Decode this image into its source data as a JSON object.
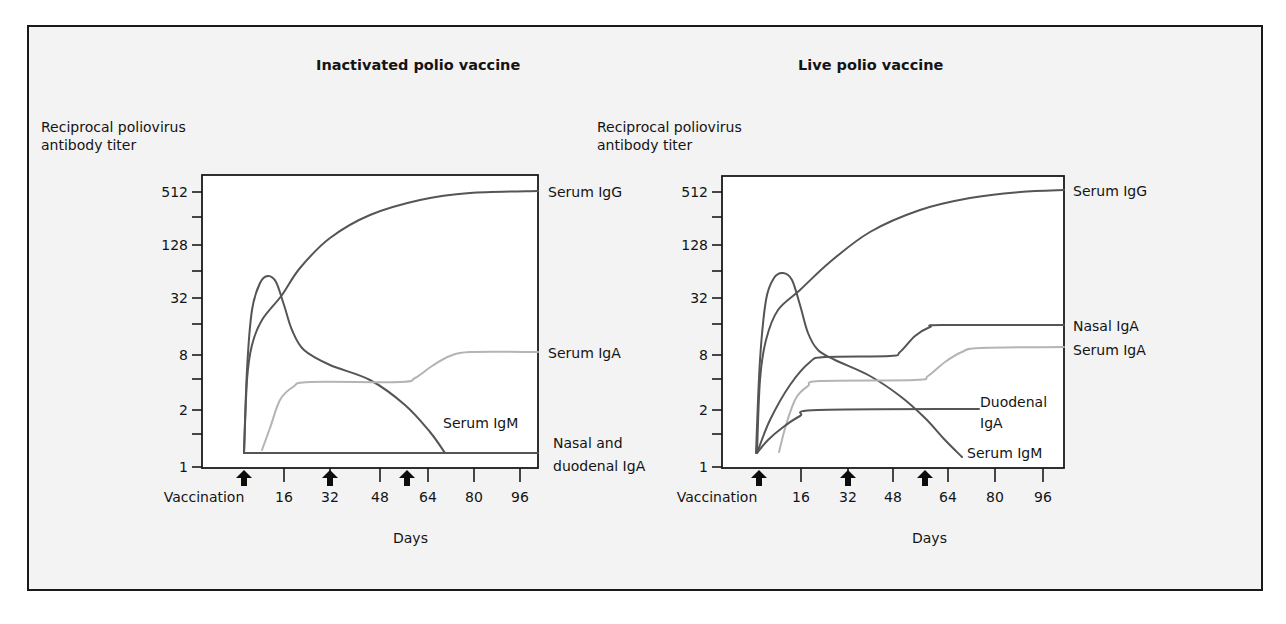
{
  "figure": {
    "background": "#f3f3f3",
    "frame_color": "#1a1a1a",
    "curve_dark": "#555555",
    "curve_light": "#b4b4b4"
  },
  "chart_data": [
    {
      "type": "line",
      "title": "Inactivated polio vaccine",
      "ylabel": "Reciprocal poliovirus antibody titer",
      "ylabel_lines": [
        "Reciprocal poliovirus",
        "antibody titer"
      ],
      "xlabel": "Days",
      "y_scale": "log2",
      "y_ticks": [
        "512",
        "128",
        "32",
        "8",
        "2",
        "1"
      ],
      "y_tick_values": [
        512,
        128,
        32,
        8,
        2,
        1
      ],
      "x_ticks": [
        "Vaccination",
        "16",
        "32",
        "48",
        "64",
        "80",
        "96"
      ],
      "x_tick_values": [
        0,
        16,
        32,
        48,
        64,
        80,
        96
      ],
      "vaccination_arrows_days": [
        0,
        31,
        58
      ],
      "ylim": [
        1,
        768
      ],
      "xlim": [
        -14,
        102
      ],
      "grid": false,
      "legend_position": "inline labels at right of curves",
      "series": [
        {
          "name": "Serum IgG",
          "style": "dark",
          "x": [
            0,
            1,
            3,
            7,
            14,
            22,
            32,
            45,
            60,
            75,
            90,
            102
          ],
          "y": [
            1.25,
            5,
            12,
            20,
            34,
            60,
            110,
            200,
            330,
            430,
            490,
            512
          ]
        },
        {
          "name": "Serum IgM",
          "style": "dark",
          "x": [
            0,
            1,
            3,
            6,
            8,
            11,
            14,
            18,
            24,
            34,
            45,
            55,
            63,
            70
          ],
          "y": [
            1.25,
            6,
            25,
            50,
            55,
            45,
            18,
            10,
            7.5,
            6,
            4.5,
            3,
            1.8,
            1.25
          ]
        },
        {
          "name": "Serum IgA",
          "style": "light",
          "x": [
            6,
            10,
            15,
            20,
            30,
            40,
            55,
            62,
            70,
            80,
            90,
            102
          ],
          "y": [
            1.25,
            2,
            3.6,
            4.5,
            4.8,
            4.8,
            4.8,
            5.2,
            6.8,
            8,
            8,
            8
          ]
        },
        {
          "name": "Nasal and duodenal IgA",
          "style": "dark",
          "x": [
            0,
            102
          ],
          "y": [
            1.25,
            1.25
          ]
        }
      ],
      "curve_labels": [
        {
          "text": "Serum IgG",
          "series": "Serum IgG"
        },
        {
          "text": "Serum IgA",
          "series": "Serum IgA"
        },
        {
          "text": "Serum IgM",
          "series": "Serum IgM"
        },
        {
          "text": "Nasal and",
          "series": "Nasal and duodenal IgA"
        },
        {
          "text": "duodenal IgA",
          "series": "Nasal and duodenal IgA"
        }
      ]
    },
    {
      "type": "line",
      "title": "Live polio vaccine",
      "ylabel": "Reciprocal poliovirus antibody titer",
      "ylabel_lines": [
        "Reciprocal poliovirus",
        "antibody titer"
      ],
      "xlabel": "Days",
      "y_scale": "log2",
      "y_ticks": [
        "512",
        "128",
        "32",
        "8",
        "2",
        "1"
      ],
      "y_tick_values": [
        512,
        128,
        32,
        8,
        2,
        1
      ],
      "x_ticks": [
        "Vaccination",
        "16",
        "32",
        "48",
        "64",
        "80",
        "96"
      ],
      "x_tick_values": [
        0,
        16,
        32,
        48,
        64,
        80,
        96
      ],
      "vaccination_arrows_days": [
        0,
        31,
        58
      ],
      "ylim": [
        1,
        768
      ],
      "xlim": [
        -14,
        102
      ],
      "grid": false,
      "legend_position": "inline labels at right of curves",
      "series": [
        {
          "name": "Serum IgG",
          "style": "dark",
          "x": [
            0,
            1,
            3,
            7,
            14,
            22,
            32,
            45,
            60,
            75,
            90,
            102
          ],
          "y": [
            1.25,
            6,
            14,
            22,
            36,
            64,
            115,
            210,
            340,
            440,
            495,
            512
          ]
        },
        {
          "name": "Serum IgM",
          "style": "dark",
          "x": [
            -1,
            1,
            3,
            6,
            8,
            11,
            14,
            18,
            24,
            34,
            45,
            55,
            62,
            70
          ],
          "y": [
            1.25,
            8,
            32,
            55,
            58,
            45,
            18,
            10,
            7.5,
            6,
            4.5,
            2.6,
            1.8,
            1.25
          ]
        },
        {
          "name": "Nasal IgA",
          "style": "dark",
          "x": [
            0,
            5,
            12,
            20,
            25,
            45,
            50,
            55,
            62,
            70,
            102
          ],
          "y": [
            1.25,
            2.5,
            5.5,
            7.5,
            8,
            8,
            8.5,
            11,
            14,
            14,
            14
          ]
        },
        {
          "name": "Serum IgA",
          "style": "light",
          "x": [
            7,
            10,
            15,
            20,
            25,
            50,
            55,
            60,
            65,
            72,
            80,
            102
          ],
          "y": [
            1.25,
            2.2,
            3.6,
            4.5,
            4.8,
            4.8,
            5.4,
            6.8,
            8.3,
            9,
            9,
            9
          ]
        },
        {
          "name": "Duodenal IgA",
          "style": "dark",
          "x": [
            0,
            5,
            12,
            20,
            25,
            80
          ],
          "y": [
            1.25,
            1.5,
            1.8,
            2,
            2,
            2
          ]
        }
      ],
      "curve_labels": [
        {
          "text": "Serum IgG",
          "series": "Serum IgG"
        },
        {
          "text": "Nasal IgA",
          "series": "Nasal IgA"
        },
        {
          "text": "Serum IgA",
          "series": "Serum IgA"
        },
        {
          "text": "Duodenal",
          "series": "Duodenal IgA"
        },
        {
          "text": "IgA",
          "series": "Duodenal IgA"
        },
        {
          "text": "Serum IgM",
          "series": "Serum IgM"
        }
      ]
    }
  ],
  "layout": {
    "panels": [
      {
        "title_pos": [
          316,
          70
        ],
        "ylabel_pos": [
          41,
          132
        ],
        "box": [
          202,
          175,
          538,
          468
        ],
        "y_tick_px": [
          192,
          245,
          298,
          355,
          410,
          467
        ],
        "minor_y_tick_px": [
          217,
          271,
          324,
          379,
          434
        ],
        "x_tick_px": [
          244,
          284,
          330,
          380,
          428,
          474,
          520
        ],
        "tick_label_px": [
          204,
          284,
          330,
          380,
          428,
          474,
          520
        ],
        "arrow_px": [
          244,
          330,
          407
        ],
        "xlabel_pos": [
          393,
          543
        ],
        "labels_pos": [
          [
            548,
            197
          ],
          [
            548,
            358
          ],
          [
            443,
            428
          ],
          [
            553,
            448
          ],
          [
            553,
            471
          ]
        ],
        "curves": [
          [
            [
              244,
              453
            ],
            [
              247,
              380
            ],
            [
              252,
              345
            ],
            [
              262,
              320
            ],
            [
              282,
              295
            ],
            [
              300,
              268
            ],
            [
              330,
              238
            ],
            [
              370,
              215
            ],
            [
              420,
              200
            ],
            [
              470,
              193
            ],
            [
              538,
              191
            ]
          ],
          [
            [
              244,
              453
            ],
            [
              247,
              370
            ],
            [
              252,
              310
            ],
            [
              260,
              283
            ],
            [
              268,
              276
            ],
            [
              276,
              282
            ],
            [
              284,
              305
            ],
            [
              292,
              330
            ],
            [
              304,
              350
            ],
            [
              330,
              365
            ],
            [
              370,
              380
            ],
            [
              405,
              405
            ],
            [
              430,
              432
            ],
            [
              445,
              453
            ]
          ],
          [
            [
              262,
              450
            ],
            [
              270,
              428
            ],
            [
              280,
              400
            ],
            [
              293,
              387
            ],
            [
              310,
              382
            ],
            [
              400,
              382
            ],
            [
              415,
              378
            ],
            [
              432,
              366
            ],
            [
              450,
              356
            ],
            [
              470,
              352
            ],
            [
              538,
              352
            ]
          ],
          [
            [
              244,
              453
            ],
            [
              538,
              453
            ]
          ]
        ]
      },
      {
        "title_pos": [
          798,
          70
        ],
        "ylabel_pos": [
          597,
          132
        ],
        "box": [
          722,
          176,
          1064,
          468
        ],
        "y_tick_px": [
          192,
          245,
          298,
          355,
          410,
          467
        ],
        "minor_y_tick_px": [
          217,
          271,
          324,
          379,
          434
        ],
        "x_tick_px": [
          759,
          801,
          848,
          893,
          948,
          995,
          1043
        ],
        "tick_label_px": [
          717,
          801,
          848,
          893,
          948,
          995,
          1043
        ],
        "arrow_px": [
          759,
          848,
          925
        ],
        "xlabel_pos": [
          912,
          543
        ],
        "labels_pos": [
          [
            1073,
            196
          ],
          [
            1073,
            331
          ],
          [
            1073,
            355
          ],
          [
            980,
            407
          ],
          [
            980,
            428
          ],
          [
            967,
            458
          ]
        ],
        "curves": [
          [
            [
              757,
              453
            ],
            [
              760,
              380
            ],
            [
              766,
              340
            ],
            [
              778,
              310
            ],
            [
              800,
              290
            ],
            [
              830,
              262
            ],
            [
              870,
              232
            ],
            [
              920,
              210
            ],
            [
              970,
              198
            ],
            [
              1020,
              192
            ],
            [
              1064,
              190
            ]
          ],
          [
            [
              756,
              453
            ],
            [
              760,
              360
            ],
            [
              766,
              300
            ],
            [
              774,
              278
            ],
            [
              783,
              273
            ],
            [
              792,
              280
            ],
            [
              800,
              305
            ],
            [
              808,
              333
            ],
            [
              818,
              350
            ],
            [
              835,
              360
            ],
            [
              870,
              376
            ],
            [
              900,
              396
            ],
            [
              925,
              418
            ],
            [
              945,
              440
            ],
            [
              962,
              457
            ]
          ],
          [
            [
              757,
              453
            ],
            [
              770,
              420
            ],
            [
              790,
              385
            ],
            [
              810,
              362
            ],
            [
              825,
              357
            ],
            [
              890,
              356
            ],
            [
              900,
              352
            ],
            [
              915,
              336
            ],
            [
              930,
              327
            ],
            [
              942,
              325
            ],
            [
              1064,
              325
            ]
          ],
          [
            [
              779,
              452
            ],
            [
              786,
              425
            ],
            [
              796,
              398
            ],
            [
              808,
              386
            ],
            [
              820,
              381
            ],
            [
              915,
              380
            ],
            [
              928,
              376
            ],
            [
              945,
              362
            ],
            [
              962,
              352
            ],
            [
              980,
              348
            ],
            [
              1064,
              347
            ]
          ],
          [
            [
              757,
              453
            ],
            [
              768,
              440
            ],
            [
              782,
              428
            ],
            [
              800,
              416
            ],
            [
              818,
              410
            ],
            [
              979,
              409
            ]
          ]
        ]
      }
    ]
  }
}
